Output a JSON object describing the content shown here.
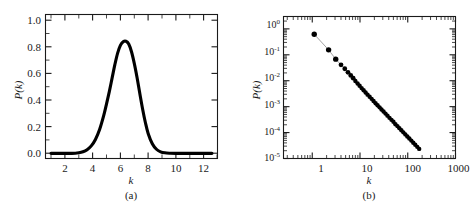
{
  "figure": {
    "background": "#ffffff",
    "ink": "#1a1a1a",
    "curve_color": "#000000",
    "marker_color": "#000000",
    "connector_color": "#8a8a8a",
    "panels": [
      "a",
      "b"
    ]
  },
  "panel_a": {
    "caption": "(a)",
    "xlabel": "k",
    "ylabel": "P(k)",
    "xticks": [
      "2",
      "4",
      "6",
      "8",
      "10",
      "12"
    ],
    "yticks": [
      "0.0",
      "0.2",
      "0.4",
      "0.6",
      "0.8",
      "1.0"
    ]
  },
  "panel_b": {
    "caption": "(b)",
    "xlabel": "k",
    "ylabel": "P(k)",
    "xticks": [
      "1",
      "10",
      "100",
      "1000"
    ],
    "yticks": [
      {
        "mantissa": "10",
        "exponent": "0"
      },
      {
        "mantissa": "10",
        "exponent": "-1"
      },
      {
        "mantissa": "10",
        "exponent": "-2"
      },
      {
        "mantissa": "10",
        "exponent": "-3"
      },
      {
        "mantissa": "10",
        "exponent": "-4"
      },
      {
        "mantissa": "10",
        "exponent": "-5"
      }
    ]
  },
  "chart_data": [
    {
      "type": "line",
      "panel": "a",
      "title": "",
      "xlabel": "k",
      "ylabel": "P(k)",
      "xlim": [
        0.6,
        13.0
      ],
      "ylim": [
        -0.04,
        1.08
      ],
      "xticks": [
        2,
        4,
        6,
        8,
        10,
        12
      ],
      "yticks": [
        0.0,
        0.2,
        0.4,
        0.6,
        0.8,
        1.0
      ],
      "grid": false,
      "legend": null,
      "description": "Poisson-like / Gaussian degree distribution peaked near k = 6.4 with peak height about 0.87",
      "peak": {
        "x": 6.4,
        "y": 0.87
      },
      "x": [
        1.0,
        1.5,
        2.0,
        2.5,
        3.0,
        3.3,
        3.6,
        3.9,
        4.2,
        4.5,
        4.8,
        5.0,
        5.2,
        5.4,
        5.6,
        5.8,
        6.0,
        6.2,
        6.4,
        6.6,
        6.8,
        7.0,
        7.2,
        7.4,
        7.6,
        7.8,
        8.0,
        8.3,
        8.6,
        8.9,
        9.2,
        9.6,
        10.0,
        10.5,
        11.0,
        11.5,
        12.0,
        12.6
      ],
      "y": [
        0.0,
        0.0,
        0.0,
        0.0,
        0.005,
        0.012,
        0.028,
        0.058,
        0.108,
        0.185,
        0.295,
        0.385,
        0.48,
        0.585,
        0.69,
        0.78,
        0.84,
        0.868,
        0.872,
        0.85,
        0.79,
        0.7,
        0.59,
        0.465,
        0.345,
        0.24,
        0.155,
        0.075,
        0.032,
        0.012,
        0.004,
        0.001,
        0.0,
        0.0,
        0.0,
        0.0,
        0.0,
        0.0
      ]
    },
    {
      "type": "scatter",
      "panel": "b",
      "title": "",
      "xlabel": "k",
      "ylabel": "P(k)",
      "xscale": "log",
      "yscale": "log",
      "xlim": [
        0.25,
        1000
      ],
      "ylim": [
        1e-05,
        3
      ],
      "xticks": [
        1,
        10,
        100,
        1000
      ],
      "yticks": [
        1,
        0.1,
        0.01,
        0.001,
        0.0001,
        1e-05
      ],
      "grid": false,
      "legend": null,
      "description": "Power-law degree distribution, straight line on log-log axes with slope about -2.2, spanning k = 1 to about 180",
      "slope": -2.2,
      "points_x": [
        1.1,
        2.2,
        3.1,
        4.0,
        4.8,
        5.6,
        6.4,
        7.2,
        8.0,
        8.9,
        9.8,
        10.8,
        11.9,
        13.1,
        14.4,
        15.9,
        17.5,
        19.2,
        21.2,
        23.3,
        25.7,
        28.2,
        31.1,
        34.2,
        37.6,
        41.4,
        45.6,
        50.1,
        55.2,
        60.7,
        66.8,
        73.5,
        80.9,
        89.0,
        97.9,
        107.8,
        118.6,
        130.5,
        143.5,
        157.9,
        173.7
      ],
      "points_y": [
        0.62,
        0.155,
        0.068,
        0.041,
        0.029,
        0.021,
        0.016,
        0.0125,
        0.0098,
        0.0078,
        0.0064,
        0.0052,
        0.0043,
        0.0035,
        0.0029,
        0.0024,
        0.002,
        0.00165,
        0.00136,
        0.00113,
        0.00094,
        0.00078,
        0.00065,
        0.00054,
        0.00045,
        0.00037,
        0.00031,
        0.00026,
        0.00021,
        0.000178,
        0.000148,
        0.000123,
        0.000102,
        8.52e-05,
        7.08e-05,
        5.89e-05,
        4.9e-05,
        4.07e-05,
        3.39e-05,
        2.82e-05,
        2.35e-05
      ]
    }
  ]
}
